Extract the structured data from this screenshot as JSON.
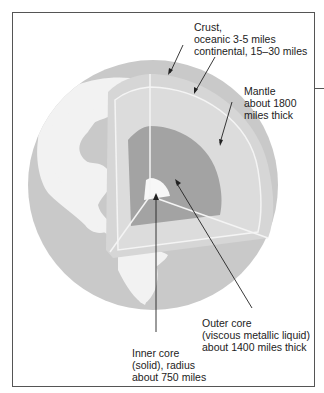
{
  "figure": {
    "labels": {
      "crust": [
        "Crust,",
        "oceanic 3-5 miles",
        "continental, 15–30 miles"
      ],
      "mantle": [
        "Mantle",
        "about 1800",
        "miles thick"
      ],
      "outer_core": [
        "Outer core",
        "(viscous metallic liquid)",
        "about 1400 miles thick"
      ],
      "inner_core": [
        "Inner core",
        "(solid), radius",
        "about 750 miles"
      ]
    },
    "colors": {
      "ocean": "#c9c9c9",
      "land": "#f2f2f2",
      "crust": "#d6d6d6",
      "mantle": "#dcdcdc",
      "outer_core": "#a3a3a3",
      "inner_core": "#f7f7f7",
      "frame": "#555555"
    }
  }
}
